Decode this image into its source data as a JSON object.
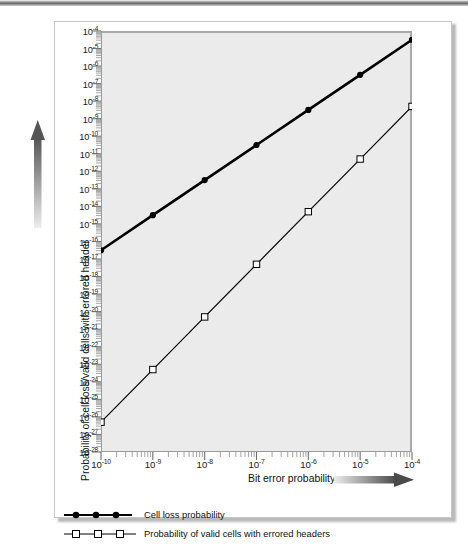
{
  "chart_data": {
    "type": "line",
    "title": "",
    "subtitle": "",
    "xlabel": "Bit error probability",
    "ylabel": "Probability of cell loss/valid cells with errored header",
    "xscale": "log",
    "yscale": "log",
    "xlim": [
      1e-10,
      0.0001
    ],
    "ylim": [
      1e-28,
      0.0001
    ],
    "grid": false,
    "legend_position": "below-plot",
    "x_tick_labels": [
      "10-10",
      "10-9",
      "10-8",
      "10-7",
      "10-6",
      "10-5",
      "10-4"
    ],
    "x_tick_mantissas": [
      "10",
      "10",
      "10",
      "10",
      "10",
      "10",
      "10"
    ],
    "x_tick_exponents": [
      "-10",
      "-9",
      "-8",
      "-7",
      "-6",
      "-5",
      "-4"
    ],
    "y_tick_mantissas": [
      "10",
      "10",
      "10",
      "10",
      "10",
      "10",
      "10",
      "10",
      "10",
      "10",
      "10",
      "10",
      "10",
      "10",
      "10",
      "10",
      "10",
      "10",
      "10",
      "10",
      "10",
      "10",
      "10",
      "10",
      "10"
    ],
    "y_tick_exponents": [
      "-4",
      "-5",
      "-6",
      "-7",
      "-8",
      "-9",
      "-10",
      "-11",
      "-12",
      "-13",
      "-14",
      "-15",
      "-16",
      "-17",
      "-18",
      "-19",
      "-20",
      "-21",
      "-22",
      "-23",
      "-24",
      "-25",
      "-26",
      "-27",
      "-28"
    ],
    "x": [
      1e-10,
      1e-09,
      1e-08,
      1e-07,
      1e-06,
      1e-05,
      0.0001
    ],
    "x_log": [
      -10,
      -9,
      -8,
      -7,
      -6,
      -5,
      -4
    ],
    "series": [
      {
        "name": "Cell loss probability",
        "marker": "filled-circle",
        "line_width": 2.6,
        "color": "#000000",
        "values_log10": [
          -16.5,
          -14.5,
          -12.5,
          -10.5,
          -8.5,
          -6.5,
          -4.5
        ],
        "values": [
          3.16e-17,
          3.16e-15,
          3.16e-13,
          3.16e-11,
          3.16e-09,
          3.16e-07,
          3.16e-05
        ]
      },
      {
        "name": "Probability of valid cells with errored headers",
        "marker": "open-square",
        "line_width": 1.2,
        "color": "#000000",
        "values_log10": [
          -26.3,
          -23.3,
          -20.3,
          -17.3,
          -14.3,
          -11.3,
          -8.3
        ],
        "values": [
          5e-27,
          5e-24,
          5e-21,
          5e-18,
          5e-15,
          5e-12,
          5e-09
        ]
      }
    ]
  },
  "legend": {
    "items": [
      {
        "label": "Cell loss probability",
        "marker": "filled-circle"
      },
      {
        "label": "Probability of valid cells with errored headers",
        "marker": "open-square"
      }
    ]
  },
  "axes": {
    "x_title": "Bit error probability",
    "y_title": "Probability of cell loss/valid cells with errored header"
  },
  "colors": {
    "plot_background": "#ebebeb",
    "card_background": "#ffffff",
    "card_border": "#c7c7c7",
    "axis_line": "#9a9a9a",
    "series_line": "#000000",
    "tick_label": "#1a1a1a",
    "arrow_dark": "#4a4a4a",
    "arrow_light": "#e4e4e4"
  }
}
